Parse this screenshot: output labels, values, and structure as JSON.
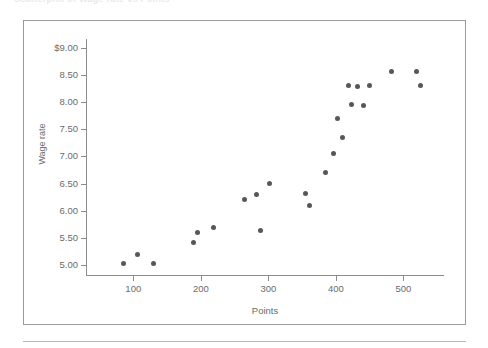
{
  "page": {
    "top_caption": "Scatterplot of Wage rate vs Points",
    "background_color": "#ffffff",
    "frame_border_color": "#9a9a9a",
    "rule_color": "#b9b9b9"
  },
  "chart_data": {
    "type": "scatter",
    "title": "",
    "xlabel": "Points",
    "ylabel": "Wage rate",
    "xlim": [
      30,
      560
    ],
    "ylim": [
      4.82,
      9.16
    ],
    "xticks": [
      100,
      200,
      300,
      400,
      500
    ],
    "xtick_labels": [
      "100",
      "200",
      "300",
      "400",
      "500"
    ],
    "yticks": [
      5.0,
      5.5,
      6.0,
      6.5,
      7.0,
      7.5,
      8.0,
      8.5,
      9.0
    ],
    "ytick_labels": [
      "5.00",
      "5.50",
      "6.00",
      "6.50",
      "7.00",
      "7.50",
      "8.00",
      "8.50",
      "$9.00"
    ],
    "grid": false,
    "legend": false,
    "marker_color": "#57575a",
    "marker_size": 5,
    "points": [
      {
        "x": 85,
        "y": 5.03
      },
      {
        "x": 106,
        "y": 5.2
      },
      {
        "x": 130,
        "y": 5.03
      },
      {
        "x": 189,
        "y": 5.41
      },
      {
        "x": 195,
        "y": 5.6
      },
      {
        "x": 219,
        "y": 5.7
      },
      {
        "x": 265,
        "y": 6.2
      },
      {
        "x": 282,
        "y": 6.3
      },
      {
        "x": 289,
        "y": 5.64
      },
      {
        "x": 301,
        "y": 6.5
      },
      {
        "x": 355,
        "y": 6.31
      },
      {
        "x": 361,
        "y": 6.1
      },
      {
        "x": 384,
        "y": 6.7
      },
      {
        "x": 396,
        "y": 7.05
      },
      {
        "x": 403,
        "y": 7.7
      },
      {
        "x": 410,
        "y": 7.34
      },
      {
        "x": 418,
        "y": 8.3
      },
      {
        "x": 423,
        "y": 7.95
      },
      {
        "x": 432,
        "y": 8.28
      },
      {
        "x": 441,
        "y": 7.93
      },
      {
        "x": 450,
        "y": 8.3
      },
      {
        "x": 483,
        "y": 8.56
      },
      {
        "x": 520,
        "y": 8.56
      },
      {
        "x": 525,
        "y": 8.31
      }
    ]
  }
}
